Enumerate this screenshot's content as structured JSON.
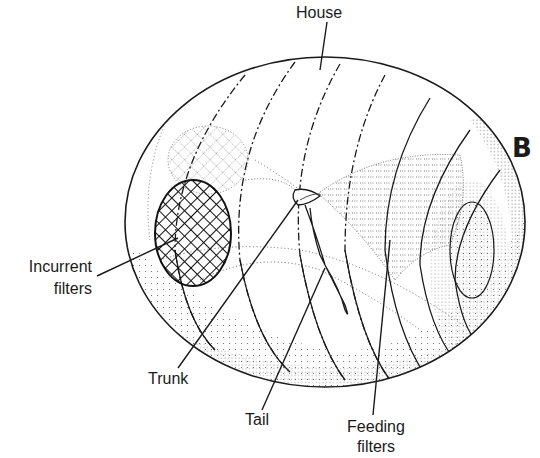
{
  "figure": {
    "panel_letter": "B",
    "labels": {
      "house": "House",
      "incurrent_line1": "Incurrent",
      "incurrent_line2": "filters",
      "trunk": "Trunk",
      "tail": "Tail",
      "feeding_line1": "Feeding",
      "feeding_line2": "filters"
    }
  }
}
